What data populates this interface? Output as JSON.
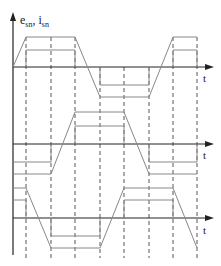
{
  "figure": {
    "y_axis_label": "e",
    "y_axis_label_sub1": "sn",
    "y_axis_label_sep": ", i",
    "y_axis_label_sub2": "sn",
    "x_axis_labels": [
      "t",
      "t",
      "t"
    ],
    "colors": {
      "axis": "#222222",
      "waveform": "#888888",
      "dashed": "#444444",
      "background": "#ffffff"
    }
  }
}
